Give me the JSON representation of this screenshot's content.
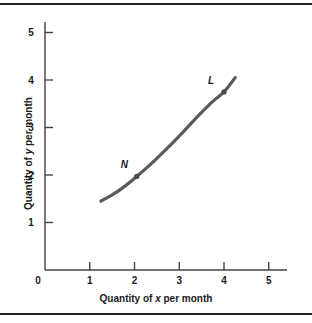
{
  "figure": {
    "background": "#ffffff",
    "rule_color": "#222222",
    "has_top_rule": true,
    "has_bottom_rule": true
  },
  "chart_data": {
    "type": "line",
    "title": "",
    "subtitle": "",
    "xlabel_prefix": "Quantity of ",
    "xlabel_variable": "x",
    "xlabel_suffix": " per month",
    "ylabel_prefix": "Quantity of ",
    "ylabel_variable": "y",
    "ylabel_suffix": " per month",
    "xlabel": "Quantity of x per month",
    "ylabel": "Quantity of y per month",
    "origin_label": "0",
    "xticks": [
      1,
      2,
      3,
      4,
      5
    ],
    "xtick_labels": [
      "1",
      "2",
      "3",
      "4",
      "5"
    ],
    "yticks": [
      1,
      2,
      3,
      4,
      5
    ],
    "ytick_labels": [
      "1",
      "2",
      "3",
      "4",
      "5"
    ],
    "xlim": [
      0,
      5.7
    ],
    "ylim": [
      0,
      5.5
    ],
    "grid": false,
    "legend": false,
    "curve_color": "#5a5a5a",
    "curve_name": "indifference-curve",
    "x": [
      1.25,
      1.5,
      1.75,
      2.05,
      2.4,
      2.75,
      3.1,
      3.45,
      3.75,
      4.0,
      4.25
    ],
    "y": [
      1.45,
      1.58,
      1.74,
      1.97,
      2.26,
      2.58,
      2.92,
      3.27,
      3.55,
      3.75,
      4.05
    ],
    "annotations": [
      {
        "label": "N",
        "x": 2.05,
        "y": 1.97,
        "marker": "dot"
      },
      {
        "label": "L",
        "x": 4.0,
        "y": 3.75,
        "marker": "dot"
      }
    ]
  }
}
